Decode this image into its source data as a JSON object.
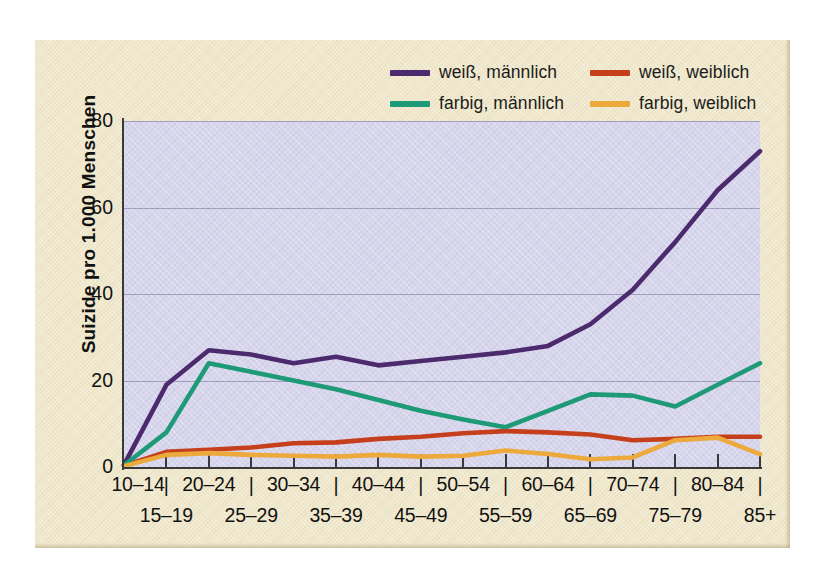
{
  "legend": {
    "items": [
      {
        "label": "weiß, männlich",
        "color": "#4b2b6e",
        "icon": "line-swatch"
      },
      {
        "label": "weiß, weiblich",
        "color": "#c63f1d",
        "icon": "line-swatch"
      },
      {
        "label": "farbig, männlich",
        "color": "#1f9a77",
        "icon": "line-swatch"
      },
      {
        "label": "farbig, weiblich",
        "color": "#eca93c",
        "icon": "line-swatch"
      }
    ]
  },
  "axes": {
    "ylabel": "Suizide pro 1.000 Menschen",
    "yticks": [
      "0",
      "20",
      "40",
      "60",
      "80"
    ],
    "ymin": 0,
    "ymax": 80
  },
  "colors": {
    "page_background": "#ffffff",
    "card_background": "#f1e9cd",
    "plot_background": "#d7d6ec",
    "axis": "#3a3a3a",
    "gridline": "#5f5c87",
    "text": "#111111"
  },
  "chart_data": {
    "type": "line",
    "title": "",
    "subtitle": "",
    "xlabel": "",
    "ylabel": "Suizide pro 1.000 Menschen",
    "ylim": [
      0,
      80
    ],
    "yticks": [
      0,
      20,
      40,
      60,
      80
    ],
    "grid": true,
    "legend_position": "top",
    "categories": [
      "10–14",
      "15–19",
      "20–24",
      "25–29",
      "30–34",
      "35–39",
      "40–44",
      "45–49",
      "50–54",
      "55–59",
      "60–64",
      "65–69",
      "70–74",
      "75–79",
      "80–84",
      "85+"
    ],
    "series": [
      {
        "name": "weiß, männlich",
        "color": "#4b2b6e",
        "values": [
          0.5,
          19,
          27,
          26,
          24,
          25.5,
          23.5,
          24.5,
          25.5,
          26.5,
          28,
          33,
          41,
          52,
          64,
          73
        ]
      },
      {
        "name": "weiß, weiblich",
        "color": "#c63f1d",
        "values": [
          0.3,
          3.5,
          4,
          4.5,
          5.5,
          5.7,
          6.5,
          7,
          7.8,
          8.3,
          8,
          7.5,
          6.2,
          6.5,
          7,
          7
        ]
      },
      {
        "name": "farbig, männlich",
        "color": "#1f9a77",
        "values": [
          0.4,
          8,
          24,
          22,
          20,
          18,
          15.5,
          13,
          11,
          9.2,
          13,
          16.8,
          16.5,
          14,
          19,
          24
        ]
      },
      {
        "name": "farbig, weiblich",
        "color": "#eca93c",
        "values": [
          0.2,
          2.8,
          3.2,
          2.8,
          2.6,
          2.4,
          2.8,
          2.4,
          2.6,
          3.8,
          3.0,
          1.8,
          2.2,
          6.2,
          6.8,
          3.0
        ]
      }
    ]
  },
  "xaxis": {
    "top_row": [
      "10–14",
      "20–24",
      "30–34",
      "40–44",
      "50–54",
      "60–64",
      "70–74",
      "80–84"
    ],
    "bottom_row": [
      "15–19",
      "25–29",
      "35–39",
      "45–49",
      "55–59",
      "65–69",
      "75–79",
      "85+"
    ],
    "separator": "|"
  }
}
